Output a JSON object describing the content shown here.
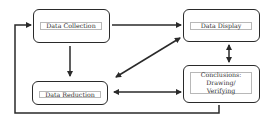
{
  "diagram": {
    "nodes": [
      {
        "id": "collection",
        "label": "Data Collection"
      },
      {
        "id": "display",
        "label": "Data Display"
      },
      {
        "id": "reduction",
        "label": "Data Reduction"
      },
      {
        "id": "conclusions",
        "label_line1": "Conclusions:",
        "label_line2": "Drawing/ Verifying"
      }
    ],
    "edges": [
      {
        "from": "collection",
        "to": "display",
        "type": "one-way"
      },
      {
        "from": "collection",
        "to": "reduction",
        "type": "one-way"
      },
      {
        "from": "display",
        "to": "reduction",
        "type": "two-way"
      },
      {
        "from": "display",
        "to": "conclusions",
        "type": "two-way"
      },
      {
        "from": "reduction",
        "to": "conclusions",
        "type": "two-way"
      },
      {
        "from": "conclusions",
        "to": "collection",
        "type": "one-way",
        "route": "bottom-left loop"
      }
    ],
    "colors": {
      "stroke": "#2a2a2a",
      "inner_border": "#b8b8b8",
      "text": "#333333"
    }
  }
}
